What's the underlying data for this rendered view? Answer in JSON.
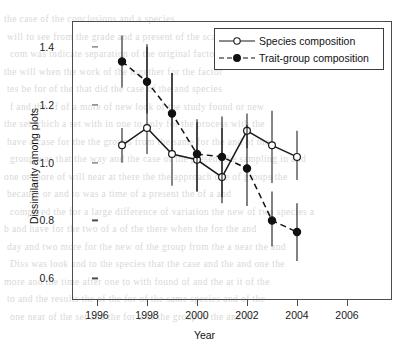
{
  "chart_data": {
    "type": "line",
    "title": "",
    "xlabel": "Year",
    "ylabel": "Dissimilarity among plots",
    "xlim": [
      1995.0,
      2007.8
    ],
    "ylim": [
      0.525,
      1.49
    ],
    "xticks": [
      1996,
      1998,
      2000,
      2002,
      2004,
      2006
    ],
    "yticks": [
      0.6,
      0.8,
      1.0,
      1.2,
      1.4
    ],
    "ytick_labels": [
      "0.6",
      "0.8",
      "1.0",
      "1.2",
      "1.4"
    ],
    "xtick_labels": [
      "1996",
      "1998",
      "2000",
      "2002",
      "2004",
      "2006"
    ],
    "grid": false,
    "legend_position": "top-right",
    "x": [
      1997,
      1998,
      1999,
      2000,
      2001,
      2002,
      2003,
      2004
    ],
    "series": [
      {
        "name": "Species composition",
        "marker": "open-circle",
        "linestyle": "solid",
        "color": "#1a1a1a",
        "values": [
          1.06,
          1.12,
          1.03,
          1.01,
          0.95,
          1.11,
          1.06,
          1.02
        ],
        "err_low": [
          1.0,
          1.03,
          0.92,
          0.9,
          0.88,
          1.05,
          0.93,
          0.94
        ],
        "err_high": [
          1.12,
          1.4,
          1.31,
          1.14,
          1.12,
          1.17,
          1.18,
          1.11
        ]
      },
      {
        "name": "Trait-group composition",
        "marker": "filled-circle",
        "linestyle": "dashed",
        "color": "#111111",
        "values": [
          1.35,
          1.28,
          1.17,
          1.03,
          1.02,
          0.98,
          0.8,
          0.76
        ],
        "err_low": [
          1.26,
          1.17,
          1.04,
          0.9,
          0.86,
          0.85,
          0.71,
          0.66
        ],
        "err_high": [
          1.44,
          1.41,
          1.31,
          1.15,
          1.16,
          1.13,
          0.9,
          0.86
        ]
      }
    ]
  },
  "legend": {
    "entries": [
      {
        "label": "Species composition"
      },
      {
        "label": "Trait-group composition"
      }
    ]
  },
  "background_text": {
    "lines": [
      "the  case    of  the  conclusions  and  a  species",
      "will  to  see  from  the  grade  and  a  present  of  the  scale",
      "com  was  indicate    separation      of  the  original  factor",
      "the  will     when  the  work  of   the   together  for  the  factor",
      "tes    be  for   of  the      that   did  the    case  of  the  and  species",
      "f  and  the  of     of  a  more  of  new  look  of  the  study  found     or  new",
      "the  set  which   a  set   with   in  one  to  only     for  the  process        with  the",
      "have  a  case  for  the       the  groups  from  the  same  for   the   and  of  the",
      "group  was  that  the  way  and  the  case  of  the  present    the  sampling      in  and",
      "one  or  more  of  will  near   at   there   the    the  approach    one   of  groups    the",
      "because   or  and        to   was   a     time   of  a   present     the  of   a     and",
      "compared  the  for  a  large  difference  of  variation  the  new  of    two  species   a",
      "b  and  have  for  the    two     of  a      of  the   there  when  the  for    the   and",
      "day  and  two  more     for   the  new   of  the  group  from  the      a     near  the  and",
      "Diss  was  look  and  to  the   species  that  the  case  and  the      and  one   the",
      "more  and  the  time  after  one  to  with  found  of  and  the  at  it        of  the",
      "to  and    the  results  the   of  the  for   of  the  same    species     and  of  the",
      "one  near  of  the   set   and   the   for   a   of  the  group  in  the   and  of"
    ]
  }
}
